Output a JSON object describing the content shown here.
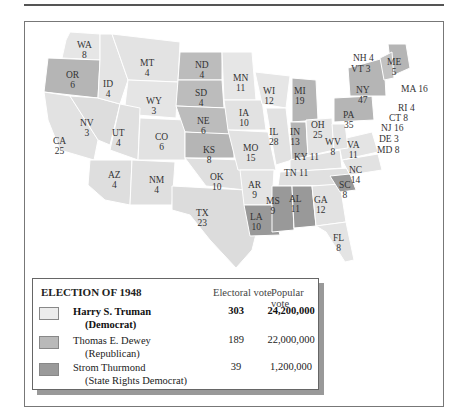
{
  "legend": {
    "title": "ELECTION OF 1948",
    "col_electoral": "Electoral vote",
    "col_popular": "Popular vote",
    "candidates": [
      {
        "name": "Harry S. Truman",
        "party": "(Democrat)",
        "electoral": "303",
        "popular": "24,200,000",
        "color": "#ececec"
      },
      {
        "name": "Thomas E. Dewey",
        "party": "(Republican)",
        "electoral": "189",
        "popular": "22,000,000",
        "color": "#b9b9b9"
      },
      {
        "name": "Strom Thurmond",
        "party": "(State Rights Democrat)",
        "electoral": "39",
        "popular": "1,200,000",
        "color": "#9a9a9a"
      }
    ]
  },
  "states": {
    "WA": "WA\n8",
    "OR": "OR\n6",
    "CA": "CA\n25",
    "ID": "ID\n4",
    "NV": "NV\n3",
    "MT": "MT\n4",
    "WY": "WY\n3",
    "UT": "UT\n4",
    "AZ": "AZ\n4",
    "CO": "CO\n6",
    "NM": "NM\n4",
    "ND": "ND\n4",
    "SD": "SD\n4",
    "NE": "NE\n6",
    "KS": "KS\n8",
    "OK": "OK\n10",
    "TX": "TX\n23",
    "MN": "MN\n11",
    "IA": "IA\n10",
    "MO": "MO\n15",
    "AR": "AR\n9",
    "LA": "LA\n10",
    "WI": "WI\n12",
    "IL": "IL\n28",
    "MI": "MI\n19",
    "IN": "IN\n13",
    "OH": "OH\n25",
    "KY": "KY 11",
    "TN": "TN 11",
    "MS": "MS\n9",
    "AL": "AL\n11",
    "GA": "GA\n12",
    "FL": "FL\n8",
    "SC": "SC\n8",
    "NC": "NC\n14",
    "VA": "VA\n11",
    "WV": "WV\n8",
    "PA": "PA\n35",
    "NY": "NY\n47",
    "ME": "ME\n5",
    "NH": "NH 4",
    "VT": "VT 3",
    "MA": "MA 16",
    "RI": "RI 4",
    "CT": "CT 8",
    "NJ": "NJ 16",
    "DE": "DE 3",
    "MD": "MD 8"
  }
}
